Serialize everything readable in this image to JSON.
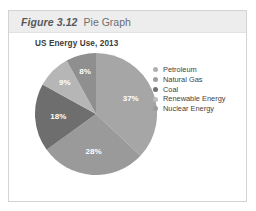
{
  "figure": {
    "number": "Figure 3.12",
    "title": "Pie Graph"
  },
  "chart_data": {
    "type": "pie",
    "title": "US Energy Use, 2013",
    "xlabel": "",
    "ylabel": "",
    "categories": [
      "Petroleum",
      "Natural Gas",
      "Coal",
      "Renewable Energy",
      "Nuclear Energy"
    ],
    "values": [
      37,
      28,
      18,
      9,
      8
    ],
    "value_labels": [
      "37%",
      "28%",
      "18%",
      "9%",
      "8%"
    ],
    "colors": [
      "#a6a6a6",
      "#9a9a9a",
      "#6e6e6e",
      "#b6b6b6",
      "#8f8f8f"
    ],
    "legend_position": "right",
    "grid": false,
    "start_angle_deg": 0,
    "slices": [
      {
        "label": "Petroleum",
        "value": 37,
        "value_label": "37%",
        "color": "#a6a6a6"
      },
      {
        "label": "Natural Gas",
        "value": 28,
        "value_label": "28%",
        "color": "#9a9a9a"
      },
      {
        "label": "Coal",
        "value": 18,
        "value_label": "18%",
        "color": "#6e6e6e"
      },
      {
        "label": "Renewable Energy",
        "value": 9,
        "value_label": "9%",
        "color": "#b6b6b6"
      },
      {
        "label": "Nuclear Energy",
        "value": 8,
        "value_label": "8%",
        "color": "#8f8f8f"
      }
    ]
  },
  "legend": {
    "items": [
      {
        "label": "Petroleum",
        "color": "#b0b0b0"
      },
      {
        "label": "Natural Gas",
        "color": "#a0a0a0"
      },
      {
        "label": "Coal",
        "color": "#737373"
      },
      {
        "label": "Renewable Energy",
        "color": "#bdbdbd"
      },
      {
        "label": "Nuclear Energy",
        "color": "#9b9b9b"
      }
    ]
  }
}
